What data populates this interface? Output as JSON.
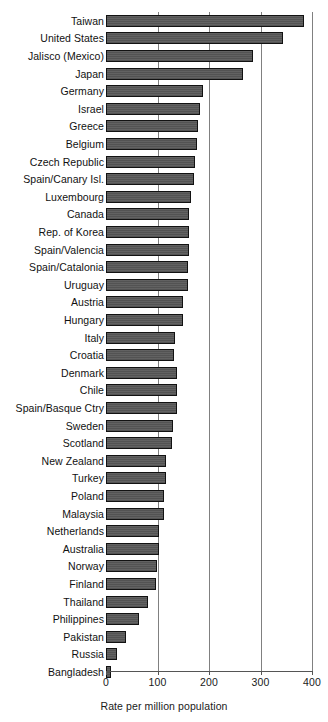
{
  "chart_data": {
    "type": "bar",
    "orientation": "horizontal",
    "title": "",
    "subtitle": "",
    "xlabel": "Rate per million population",
    "ylabel": "",
    "xlim": [
      0,
      400
    ],
    "xticks": [
      0,
      100,
      200,
      300,
      400
    ],
    "xtick_labels": [
      "0",
      "100",
      "200",
      "300",
      "400"
    ],
    "grid": "vertical",
    "legend": "none",
    "bar_color": "#565656",
    "bar_edge_color": "#121212",
    "gridline_color": "#808080",
    "axis_color": "#555555",
    "categories": [
      "Taiwan",
      "United States",
      "Jalisco (Mexico)",
      "Japan",
      "Germany",
      "Israel",
      "Greece",
      "Belgium",
      "Czech Republic",
      "Spain/Canary Isl.",
      "Luxembourg",
      "Canada",
      "Rep. of Korea",
      "Spain/Valencia",
      "Spain/Catalonia",
      "Uruguay",
      "Austria",
      "Hungary",
      "Italy",
      "Croatia",
      "Denmark",
      "Chile",
      "Spain/Basque Ctry",
      "Sweden",
      "Scotland",
      "New Zealand",
      "Turkey",
      "Poland",
      "Malaysia",
      "Netherlands",
      "Australia",
      "Norway",
      "Finland",
      "Thailand",
      "Philippines",
      "Pakistan",
      "Russia",
      "Bangladesh"
    ],
    "values": [
      385,
      344,
      285,
      266,
      188,
      183,
      179,
      176,
      172,
      170,
      165,
      162,
      162,
      161,
      159,
      159,
      150,
      149,
      134,
      133,
      137,
      137,
      137,
      130,
      129,
      117,
      117,
      113,
      113,
      103,
      103,
      99,
      98,
      82,
      65,
      39,
      21,
      10
    ]
  }
}
